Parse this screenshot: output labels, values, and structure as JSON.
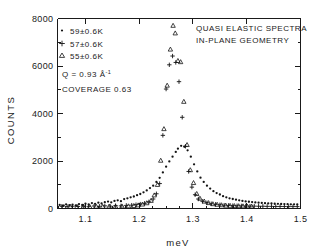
{
  "figure": {
    "title_lines": [
      "QUASI ELASTIC SPECTRA",
      "IN-PLANE GEOMETRY"
    ],
    "annotations": {
      "q_label": "Q = 0.93 Å",
      "q_exponent": "-1",
      "coverage": "COVERAGE 0.63"
    }
  },
  "legend": {
    "items": [
      {
        "marker": "dot-marker",
        "label": "59±0.6K"
      },
      {
        "marker": "plus-marker",
        "label": "57±0.6K"
      },
      {
        "marker": "triangle-marker",
        "label": "55±0.6K"
      }
    ]
  },
  "axes": {
    "x": {
      "label": "meV",
      "ticklabels": [
        "1.1",
        "1.2",
        "1.3",
        "1.4",
        "1.5"
      ],
      "tickvalues": [
        1.1,
        1.2,
        1.3,
        1.4,
        1.5
      ]
    },
    "y": {
      "label": "COUNTS",
      "ticklabels": [
        "0",
        "2000",
        "4000",
        "6000",
        "8000"
      ],
      "tickvalues": [
        0,
        2000,
        4000,
        6000,
        8000
      ]
    }
  },
  "chart_data": {
    "type": "scatter",
    "title": "QUASI ELASTIC SPECTRA IN-PLANE GEOMETRY",
    "xlabel": "meV",
    "ylabel": "COUNTS",
    "xlim": [
      1.048,
      1.5
    ],
    "ylim": [
      0,
      8000
    ],
    "xticks": [
      1.1,
      1.2,
      1.3,
      1.4,
      1.5
    ],
    "yticks": [
      0,
      2000,
      4000,
      6000,
      8000
    ],
    "x_minor_interval": 0.025,
    "y_minor_interval": 1000,
    "grid": false,
    "legend_position": "upper-left",
    "annotations": [
      "Q = 0.93 Å-1",
      "COVERAGE 0.63"
    ],
    "series": [
      {
        "name": "59±0.6K",
        "marker": "dot",
        "points": [
          [
            1.052,
            150
          ],
          [
            1.058,
            120
          ],
          [
            1.064,
            175
          ],
          [
            1.07,
            140
          ],
          [
            1.076,
            165
          ],
          [
            1.082,
            130
          ],
          [
            1.088,
            185
          ],
          [
            1.094,
            150
          ],
          [
            1.1,
            200
          ],
          [
            1.106,
            170
          ],
          [
            1.112,
            230
          ],
          [
            1.118,
            195
          ],
          [
            1.124,
            245
          ],
          [
            1.13,
            210
          ],
          [
            1.136,
            265
          ],
          [
            1.142,
            290
          ],
          [
            1.148,
            260
          ],
          [
            1.154,
            320
          ],
          [
            1.16,
            345
          ],
          [
            1.166,
            310
          ],
          [
            1.172,
            395
          ],
          [
            1.178,
            430
          ],
          [
            1.184,
            470
          ],
          [
            1.19,
            505
          ],
          [
            1.196,
            560
          ],
          [
            1.202,
            610
          ],
          [
            1.208,
            680
          ],
          [
            1.214,
            760
          ],
          [
            1.22,
            860
          ],
          [
            1.226,
            960
          ],
          [
            1.232,
            1120
          ],
          [
            1.238,
            1290
          ],
          [
            1.244,
            1520
          ],
          [
            1.25,
            1760
          ],
          [
            1.256,
            1980
          ],
          [
            1.262,
            2180
          ],
          [
            1.268,
            2380
          ],
          [
            1.272,
            2520
          ],
          [
            1.278,
            2640
          ],
          [
            1.284,
            2600
          ],
          [
            1.29,
            2450
          ],
          [
            1.296,
            2180
          ],
          [
            1.302,
            1860
          ],
          [
            1.308,
            1560
          ],
          [
            1.314,
            1300
          ],
          [
            1.32,
            1120
          ],
          [
            1.326,
            960
          ],
          [
            1.332,
            840
          ],
          [
            1.338,
            730
          ],
          [
            1.344,
            650
          ],
          [
            1.35,
            590
          ],
          [
            1.356,
            520
          ],
          [
            1.362,
            470
          ],
          [
            1.368,
            430
          ],
          [
            1.374,
            400
          ],
          [
            1.38,
            370
          ],
          [
            1.386,
            345
          ],
          [
            1.392,
            320
          ],
          [
            1.398,
            300
          ],
          [
            1.404,
            285
          ],
          [
            1.41,
            270
          ],
          [
            1.416,
            255
          ],
          [
            1.422,
            245
          ],
          [
            1.428,
            235
          ],
          [
            1.434,
            225
          ],
          [
            1.44,
            215
          ],
          [
            1.446,
            210
          ],
          [
            1.452,
            200
          ],
          [
            1.458,
            195
          ],
          [
            1.464,
            190
          ],
          [
            1.47,
            185
          ],
          [
            1.476,
            180
          ],
          [
            1.482,
            175
          ],
          [
            1.488,
            175
          ],
          [
            1.494,
            170
          ]
        ]
      },
      {
        "name": "57±0.6K",
        "marker": "plus",
        "points": [
          [
            1.056,
            90
          ],
          [
            1.066,
            80
          ],
          [
            1.076,
            95
          ],
          [
            1.086,
            85
          ],
          [
            1.096,
            100
          ],
          [
            1.106,
            90
          ],
          [
            1.116,
            105
          ],
          [
            1.126,
            95
          ],
          [
            1.136,
            110
          ],
          [
            1.146,
            100
          ],
          [
            1.156,
            120
          ],
          [
            1.166,
            110
          ],
          [
            1.176,
            130
          ],
          [
            1.186,
            140
          ],
          [
            1.194,
            160
          ],
          [
            1.202,
            185
          ],
          [
            1.21,
            220
          ],
          [
            1.218,
            280
          ],
          [
            1.226,
            400
          ],
          [
            1.232,
            620
          ],
          [
            1.238,
            1050
          ],
          [
            1.244,
            3080
          ],
          [
            1.25,
            5030
          ],
          [
            1.256,
            6050
          ],
          [
            1.262,
            6420
          ],
          [
            1.268,
            6150
          ],
          [
            1.274,
            5340
          ],
          [
            1.28,
            3840
          ],
          [
            1.286,
            2620
          ],
          [
            1.292,
            1560
          ],
          [
            1.298,
            900
          ],
          [
            1.304,
            580
          ],
          [
            1.31,
            400
          ],
          [
            1.318,
            300
          ],
          [
            1.326,
            240
          ],
          [
            1.334,
            200
          ],
          [
            1.342,
            175
          ],
          [
            1.35,
            155
          ],
          [
            1.358,
            140
          ],
          [
            1.366,
            130
          ],
          [
            1.374,
            120
          ],
          [
            1.382,
            115
          ],
          [
            1.39,
            110
          ],
          [
            1.398,
            105
          ],
          [
            1.406,
            100
          ],
          [
            1.414,
            100
          ],
          [
            1.422,
            95
          ],
          [
            1.43,
            95
          ],
          [
            1.438,
            90
          ],
          [
            1.446,
            90
          ],
          [
            1.454,
            85
          ],
          [
            1.462,
            85
          ],
          [
            1.47,
            85
          ],
          [
            1.478,
            80
          ],
          [
            1.486,
            80
          ],
          [
            1.494,
            80
          ]
        ]
      },
      {
        "name": "55±0.6K",
        "marker": "triangle",
        "points": [
          [
            1.06,
            70
          ],
          [
            1.072,
            75
          ],
          [
            1.084,
            70
          ],
          [
            1.096,
            80
          ],
          [
            1.108,
            75
          ],
          [
            1.12,
            85
          ],
          [
            1.132,
            80
          ],
          [
            1.144,
            90
          ],
          [
            1.156,
            85
          ],
          [
            1.168,
            95
          ],
          [
            1.18,
            100
          ],
          [
            1.19,
            115
          ],
          [
            1.198,
            140
          ],
          [
            1.206,
            175
          ],
          [
            1.214,
            230
          ],
          [
            1.222,
            330
          ],
          [
            1.228,
            560
          ],
          [
            1.234,
            1000
          ],
          [
            1.24,
            2020
          ],
          [
            1.246,
            3350
          ],
          [
            1.252,
            5180
          ],
          [
            1.258,
            6700
          ],
          [
            1.263,
            7700
          ],
          [
            1.267,
            7380
          ],
          [
            1.272,
            6220
          ],
          [
            1.277,
            6170
          ],
          [
            1.283,
            4500
          ],
          [
            1.289,
            2680
          ],
          [
            1.295,
            1620
          ],
          [
            1.301,
            1080
          ],
          [
            1.307,
            620
          ],
          [
            1.313,
            420
          ],
          [
            1.321,
            300
          ],
          [
            1.329,
            235
          ],
          [
            1.337,
            190
          ],
          [
            1.345,
            165
          ],
          [
            1.353,
            145
          ],
          [
            1.361,
            130
          ],
          [
            1.369,
            120
          ],
          [
            1.377,
            110
          ],
          [
            1.385,
            105
          ],
          [
            1.393,
            100
          ],
          [
            1.401,
            95
          ],
          [
            1.409,
            90
          ]
        ]
      }
    ]
  }
}
